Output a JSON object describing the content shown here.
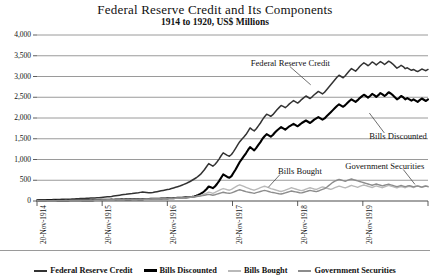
{
  "chart_data": {
    "type": "line",
    "title": "Federal Reserve Credit and Its Components",
    "subtitle": "1914 to 1920, US$ Millions",
    "xlabel": "",
    "ylabel": "",
    "ylim": [
      0,
      4000
    ],
    "ytick_values": [
      0,
      500,
      1000,
      1500,
      2000,
      2500,
      3000,
      3500,
      4000
    ],
    "ytick_labels": [
      "0",
      "500",
      "1,000",
      "1,500",
      "2,000",
      "2,500",
      "3,000",
      "3,500",
      "4,000"
    ],
    "xtick_labels": [
      "20-Nov-1914",
      "20-Nov-1915",
      "20-Nov-1916",
      "20-Nov-1917",
      "20-Nov-1918",
      "20-Nov-1919",
      "20-Nov-1920"
    ],
    "xlim": [
      0,
      6
    ],
    "grid": true,
    "legend_position": "bottom",
    "annotations": [
      {
        "text": "Federal Reserve Credit",
        "x": 3.28,
        "y": 3330
      },
      {
        "text": "Bills Discounted",
        "x": 5.1,
        "y": 1570
      },
      {
        "text": "Bills Bought",
        "x": 3.7,
        "y": 730
      },
      {
        "text": "Government Securities",
        "x": 4.73,
        "y": 835
      }
    ],
    "series": [
      {
        "name": "Federal Reserve Credit",
        "color": "#333333",
        "width": 1.5,
        "values": [
          20,
          22,
          24,
          26,
          25,
          28,
          30,
          32,
          35,
          34,
          36,
          38,
          40,
          42,
          44,
          43,
          45,
          48,
          50,
          52,
          55,
          58,
          60,
          62,
          65,
          68,
          70,
          72,
          75,
          78,
          80,
          85,
          90,
          95,
          100,
          105,
          110,
          118,
          125,
          132,
          140,
          148,
          155,
          160,
          168,
          175,
          180,
          188,
          195,
          200,
          208,
          215,
          210,
          205,
          200,
          198,
          205,
          215,
          225,
          235,
          245,
          255,
          265,
          275,
          285,
          300,
          315,
          330,
          345,
          360,
          380,
          400,
          420,
          445,
          470,
          500,
          530,
          560,
          600,
          640,
          700,
          760,
          830,
          900,
          870,
          840,
          880,
          940,
          1010,
          1090,
          1160,
          1130,
          1100,
          1080,
          1120,
          1190,
          1270,
          1350,
          1430,
          1490,
          1540,
          1600,
          1680,
          1760,
          1720,
          1690,
          1740,
          1810,
          1880,
          1960,
          2030,
          2090,
          2070,
          2040,
          2080,
          2140,
          2200,
          2250,
          2300,
          2280,
          2250,
          2290,
          2340,
          2380,
          2420,
          2390,
          2360,
          2400,
          2450,
          2490,
          2530,
          2500,
          2470,
          2510,
          2560,
          2600,
          2640,
          2610,
          2580,
          2620,
          2680,
          2740,
          2800,
          2860,
          2920,
          2980,
          3030,
          3000,
          2970,
          3020,
          3080,
          3140,
          3190,
          3160,
          3130,
          3180,
          3240,
          3290,
          3330,
          3300,
          3260,
          3300,
          3350,
          3320,
          3280,
          3320,
          3360,
          3330,
          3290,
          3330,
          3370,
          3340,
          3300,
          3250,
          3200,
          3230,
          3270,
          3240,
          3190,
          3210,
          3180,
          3150,
          3170,
          3140,
          3120,
          3150,
          3180,
          3160,
          3140,
          3170
        ]
      },
      {
        "name": "Bills Discounted",
        "color": "#000000",
        "width": 2.1,
        "values": [
          8,
          9,
          10,
          11,
          10,
          12,
          13,
          12,
          14,
          13,
          15,
          14,
          16,
          15,
          17,
          16,
          18,
          17,
          19,
          18,
          20,
          19,
          21,
          20,
          22,
          21,
          23,
          22,
          24,
          23,
          25,
          26,
          28,
          27,
          29,
          30,
          32,
          31,
          33,
          35,
          36,
          38,
          37,
          39,
          41,
          40,
          42,
          44,
          43,
          45,
          47,
          46,
          48,
          50,
          49,
          51,
          53,
          55,
          54,
          56,
          58,
          60,
          62,
          64,
          66,
          68,
          70,
          72,
          75,
          78,
          80,
          84,
          88,
          92,
          96,
          100,
          110,
          125,
          145,
          170,
          200,
          240,
          290,
          350,
          330,
          310,
          350,
          410,
          480,
          560,
          640,
          610,
          580,
          560,
          600,
          680,
          760,
          850,
          940,
          1010,
          1080,
          1150,
          1230,
          1300,
          1260,
          1220,
          1280,
          1350,
          1420,
          1500,
          1560,
          1610,
          1580,
          1550,
          1590,
          1650,
          1700,
          1740,
          1780,
          1750,
          1720,
          1760,
          1800,
          1830,
          1860,
          1830,
          1800,
          1840,
          1880,
          1910,
          1940,
          1910,
          1880,
          1920,
          1960,
          1990,
          2020,
          1990,
          1960,
          1990,
          2040,
          2090,
          2140,
          2190,
          2240,
          2290,
          2330,
          2300,
          2270,
          2310,
          2360,
          2410,
          2450,
          2420,
          2390,
          2430,
          2480,
          2520,
          2560,
          2530,
          2490,
          2530,
          2580,
          2550,
          2510,
          2550,
          2600,
          2570,
          2530,
          2570,
          2620,
          2590,
          2550,
          2500,
          2450,
          2480,
          2530,
          2500,
          2450,
          2480,
          2450,
          2420,
          2450,
          2420,
          2390,
          2430,
          2470,
          2440,
          2410,
          2450
        ]
      },
      {
        "name": "Bills Bought",
        "color": "#b9b9b9",
        "width": 1.4,
        "values": [
          2,
          3,
          4,
          5,
          4,
          6,
          7,
          6,
          8,
          7,
          9,
          8,
          10,
          9,
          11,
          10,
          12,
          11,
          13,
          12,
          14,
          13,
          15,
          14,
          16,
          15,
          17,
          16,
          18,
          17,
          19,
          20,
          22,
          21,
          23,
          24,
          26,
          25,
          27,
          29,
          30,
          32,
          31,
          33,
          35,
          34,
          36,
          38,
          37,
          39,
          41,
          40,
          42,
          44,
          43,
          45,
          47,
          49,
          48,
          50,
          52,
          54,
          56,
          58,
          60,
          62,
          64,
          66,
          68,
          70,
          74,
          78,
          82,
          86,
          90,
          95,
          100,
          110,
          120,
          135,
          150,
          170,
          190,
          215,
          200,
          185,
          205,
          230,
          255,
          280,
          300,
          285,
          270,
          260,
          280,
          310,
          340,
          370,
          390,
          370,
          350,
          330,
          310,
          290,
          275,
          260,
          280,
          300,
          320,
          340,
          355,
          340,
          320,
          300,
          285,
          270,
          255,
          240,
          230,
          245,
          260,
          280,
          300,
          320,
          305,
          290,
          275,
          260,
          250,
          265,
          285,
          305,
          320,
          305,
          290,
          280,
          300,
          320,
          340,
          325,
          310,
          295,
          280,
          300,
          320,
          340,
          360,
          345,
          330,
          315,
          335,
          355,
          375,
          360,
          345,
          330,
          350,
          370,
          385,
          370,
          355,
          340,
          325,
          345,
          365,
          350,
          335,
          320,
          340,
          360,
          375,
          360,
          345,
          330,
          315,
          335,
          350,
          335,
          320,
          340,
          355,
          340,
          325,
          345,
          360,
          345,
          330,
          350,
          365,
          350
        ]
      },
      {
        "name": "Government Securities",
        "color": "#8c8c8c",
        "width": 1.4,
        "values": [
          5,
          6,
          7,
          8,
          7,
          9,
          10,
          9,
          11,
          10,
          12,
          11,
          13,
          12,
          14,
          13,
          15,
          14,
          16,
          15,
          17,
          16,
          18,
          17,
          19,
          18,
          20,
          19,
          21,
          20,
          22,
          23,
          25,
          24,
          26,
          27,
          29,
          28,
          30,
          32,
          33,
          35,
          34,
          36,
          38,
          37,
          39,
          41,
          40,
          42,
          44,
          43,
          45,
          47,
          46,
          48,
          50,
          52,
          51,
          53,
          55,
          57,
          59,
          61,
          63,
          65,
          67,
          69,
          71,
          73,
          77,
          81,
          85,
          89,
          93,
          97,
          101,
          108,
          115,
          122,
          130,
          140,
          150,
          160,
          150,
          140,
          150,
          165,
          180,
          195,
          210,
          200,
          190,
          185,
          195,
          215,
          235,
          255,
          270,
          255,
          240,
          225,
          215,
          205,
          195,
          185,
          200,
          215,
          230,
          245,
          255,
          245,
          230,
          215,
          205,
          195,
          185,
          175,
          170,
          180,
          195,
          210,
          225,
          240,
          230,
          220,
          210,
          200,
          195,
          210,
          225,
          240,
          255,
          245,
          235,
          225,
          240,
          260,
          280,
          300,
          330,
          370,
          410,
          450,
          480,
          500,
          520,
          505,
          490,
          475,
          495,
          515,
          530,
          515,
          500,
          485,
          470,
          455,
          440,
          425,
          410,
          395,
          380,
          395,
          410,
          395,
          380,
          365,
          380,
          395,
          405,
          390,
          375,
          360,
          345,
          360,
          375,
          360,
          345,
          360,
          370,
          355,
          340,
          355,
          365,
          350,
          335,
          350,
          360,
          345
        ]
      }
    ]
  },
  "legend": {
    "items": [
      {
        "label": "Federal Reserve Credit",
        "color": "#333333",
        "width": 2
      },
      {
        "label": "Bills Discounted",
        "color": "#000000",
        "width": 3
      },
      {
        "label": "Bills Bought",
        "color": "#b9b9b9",
        "width": 2
      },
      {
        "label": "Government Securities",
        "color": "#8c8c8c",
        "width": 2
      }
    ]
  }
}
